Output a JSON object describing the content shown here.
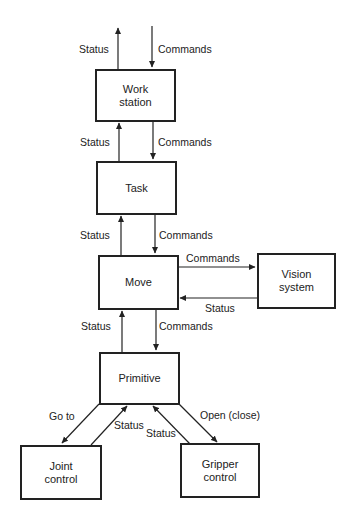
{
  "diagram": {
    "type": "hierarchical-control-block-diagram",
    "nodes": [
      {
        "id": "workstation",
        "label_line1": "Work",
        "label_line2": "station"
      },
      {
        "id": "task",
        "label": "Task"
      },
      {
        "id": "move",
        "label": "Move"
      },
      {
        "id": "vision",
        "label_line1": "Vision",
        "label_line2": "system"
      },
      {
        "id": "primitive",
        "label": "Primitive"
      },
      {
        "id": "joint",
        "label_line1": "Joint",
        "label_line2": "control"
      },
      {
        "id": "gripper",
        "label_line1": "Gripper",
        "label_line2": "control"
      }
    ],
    "edges": {
      "top_status": "Status",
      "top_commands": "Commands",
      "ws_task_status": "Status",
      "ws_task_commands": "Commands",
      "task_move_status": "Status",
      "task_move_commands": "Commands",
      "move_vision_commands": "Commands",
      "vision_move_status": "Status",
      "move_prim_status": "Status",
      "move_prim_commands": "Commands",
      "prim_joint_goto": "Go to",
      "joint_prim_status": "Status",
      "gripper_prim_status": "Status",
      "prim_gripper_open": "Open (close)"
    },
    "colors": {
      "line": "#222222",
      "background": "#ffffff"
    }
  }
}
